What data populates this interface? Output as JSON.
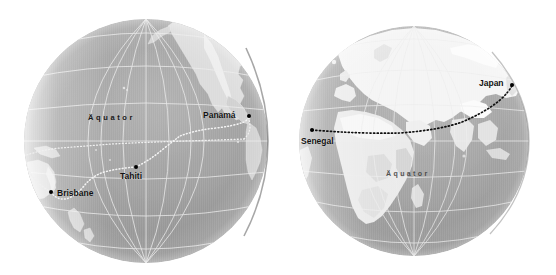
{
  "figure": {
    "name": "two-hemisphere-globe-map",
    "background_color": "#ffffff",
    "width": 556,
    "height": 275,
    "style": "grayscale shaded-relief orthographic globes"
  },
  "globes": [
    {
      "id": "pacific-globe",
      "name": "Pacific Hemisphere Globe",
      "center_x": 146,
      "center_y": 141,
      "radius": 122,
      "ocean_color": "#9a9a9a",
      "land_color": "#d8d8d8",
      "graticule_color": "#e8e8e8",
      "equator_label": "Äquator",
      "equator_label_x": 88,
      "equator_label_y": 118,
      "route_color": "#f2f2f2",
      "route_style": "dotted",
      "cities": [
        {
          "name": "Panamá",
          "label": "Panamá",
          "dot_x": 249,
          "dot_y": 116,
          "label_x": 207,
          "label_y": 112,
          "label_anchor": "left-of-dot"
        },
        {
          "name": "Tahiti",
          "label": "Tahiti",
          "dot_x": 136,
          "dot_y": 167,
          "label_x": 120,
          "label_y": 174,
          "label_anchor": "below-dot"
        },
        {
          "name": "Brisbane",
          "label": "Brisbane",
          "dot_x": 51,
          "dot_y": 192,
          "label_x": 58,
          "label_y": 190,
          "label_anchor": "right-of-dot"
        }
      ]
    },
    {
      "id": "afroeurasia-globe",
      "name": "Africa-Eurasia Hemisphere Globe",
      "center_x": 414,
      "center_y": 141,
      "radius": 115,
      "ocean_color": "#9e9e9e",
      "land_color": "#f2f2f2",
      "graticule_color": "#e8e8e8",
      "equator_label": "Äquator",
      "equator_label_x": 386,
      "equator_label_y": 172,
      "route_color": "#101010",
      "route_style": "dotted",
      "cities": [
        {
          "name": "Japan",
          "label": "Japan",
          "dot_x": 512,
          "dot_y": 85,
          "label_x": 481,
          "label_y": 80,
          "label_anchor": "left-of-dot"
        },
        {
          "name": "Senegal",
          "label": "Senegal",
          "dot_x": 312,
          "dot_y": 130,
          "label_x": 302,
          "label_y": 140,
          "label_anchor": "below-dot"
        }
      ]
    }
  ],
  "routes": [
    {
      "id": "pacific-route",
      "name": "Brisbane to Panamá via Tahiti",
      "globe": "pacific-globe",
      "waypoints": [
        "Brisbane",
        "Tahiti",
        "Panamá"
      ],
      "color": "#f2f2f2"
    },
    {
      "id": "afroeurasia-route",
      "name": "Senegal to Japan",
      "globe": "afroeurasia-globe",
      "waypoints": [
        "Senegal",
        "Japan"
      ],
      "color": "#101010"
    }
  ]
}
